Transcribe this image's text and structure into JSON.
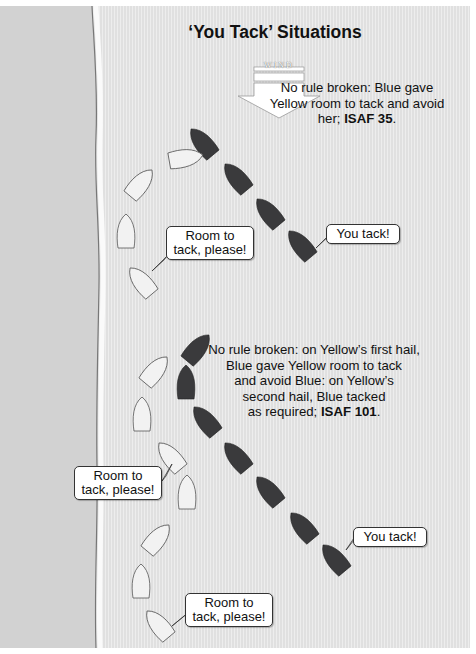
{
  "title": "‘You Tack’ Situations",
  "wind": {
    "label": "WIND",
    "icon": "wind-arrow-down"
  },
  "scenario_1": {
    "note_lines": [
      "No rule broken: Blue gave",
      "Yellow room to tack and avoid"
    ],
    "note_last_prefix": "her; ",
    "note_last_bold": "ISAF 35",
    "note_last_suffix": ".",
    "yellow_hail": "Room to tack, please!",
    "yellow_hail_lines": [
      "Room to",
      "tack, please!"
    ],
    "blue_reply": "You tack!"
  },
  "scenario_2": {
    "note_lines": [
      "No rule broken: on Yellow’s first hail,",
      "Blue gave Yellow room to tack",
      "and avoid Blue: on Yellow’s",
      "second hail, Blue tacked"
    ],
    "note_last_prefix": "as required; ",
    "note_last_bold": "ISAF 101",
    "note_last_suffix": ".",
    "yellow_hail_1_lines": [
      "Room to",
      "tack, please!"
    ],
    "yellow_hail_2_lines": [
      "Room to",
      "tack, please!"
    ],
    "blue_reply": "You tack!"
  },
  "colors": {
    "land": "#d2d2d2",
    "water": "#e4e4e4",
    "blue_boat": "#3a3a3c",
    "yellow_boat": "#f2f2f2",
    "shore_line": "#7a7a7a"
  }
}
